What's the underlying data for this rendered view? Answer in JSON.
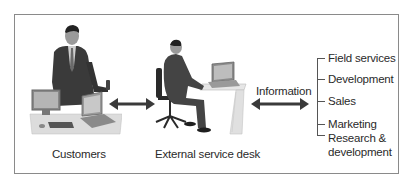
{
  "diagram": {
    "nodes": {
      "customers": {
        "label": "Customers"
      },
      "service_desk": {
        "label": "External service desk"
      }
    },
    "connector_label": "Information",
    "departments": [
      {
        "label": "Field services"
      },
      {
        "label": "Development"
      },
      {
        "label": "Sales"
      },
      {
        "label": "Marketing"
      },
      {
        "label": "Research &",
        "label2": "development"
      }
    ],
    "colors": {
      "frame": "#8a8a8a",
      "arrow": "#3a3a3a",
      "text": "#2a2a2a",
      "suit": "#3b3b3b",
      "desk": "#e2e2e2"
    }
  }
}
